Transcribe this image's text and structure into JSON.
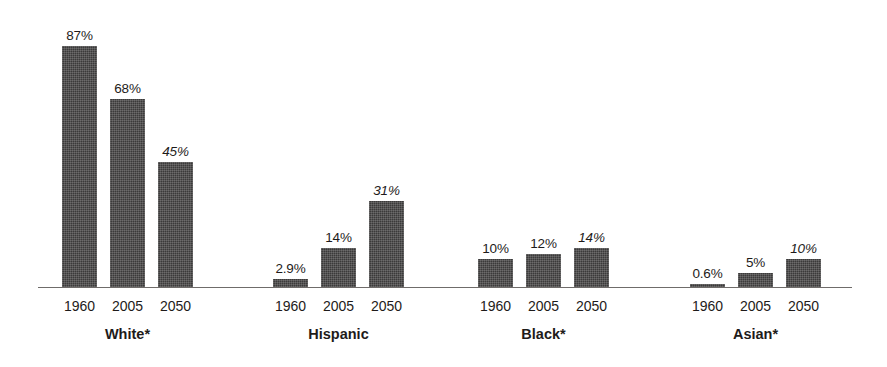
{
  "chart_data": {
    "type": "bar",
    "title": "",
    "subtitle": "",
    "xlabel": "",
    "ylabel": "",
    "ylim": [
      0,
      87
    ],
    "grid": false,
    "legend": "none",
    "axis": {
      "baseline_visible": true,
      "y_axis_visible": false
    },
    "categories": [
      "White*",
      "Hispanic",
      "Black*",
      "Asian*"
    ],
    "x": [
      "1960",
      "2005",
      "2050"
    ],
    "series": [
      {
        "name": "1960",
        "values": [
          87,
          2.9,
          10,
          0.6
        ]
      },
      {
        "name": "2005",
        "values": [
          68,
          14,
          12,
          5
        ]
      },
      {
        "name": "2050",
        "values": [
          45,
          31,
          14,
          10
        ]
      }
    ],
    "groups": [
      {
        "label": "White*",
        "bars": [
          {
            "year": "1960",
            "value": 87,
            "value_label": "87%",
            "projected": false
          },
          {
            "year": "2005",
            "value": 68,
            "value_label": "68%",
            "projected": false
          },
          {
            "year": "2050",
            "value": 45,
            "value_label": "45%",
            "projected": true
          }
        ]
      },
      {
        "label": "Hispanic",
        "bars": [
          {
            "year": "1960",
            "value": 2.9,
            "value_label": "2.9%",
            "projected": false
          },
          {
            "year": "2005",
            "value": 14,
            "value_label": "14%",
            "projected": false
          },
          {
            "year": "2050",
            "value": 31,
            "value_label": "31%",
            "projected": true
          }
        ]
      },
      {
        "label": "Black*",
        "bars": [
          {
            "year": "1960",
            "value": 10,
            "value_label": "10%",
            "projected": false
          },
          {
            "year": "2005",
            "value": 12,
            "value_label": "12%",
            "projected": false
          },
          {
            "year": "2050",
            "value": 14,
            "value_label": "14%",
            "projected": true
          }
        ]
      },
      {
        "label": "Asian*",
        "bars": [
          {
            "year": "1960",
            "value": 0.6,
            "value_label": "0.6%",
            "projected": false
          },
          {
            "year": "2005",
            "value": 5,
            "value_label": "5%",
            "projected": false
          },
          {
            "year": "2050",
            "value": 10,
            "value_label": "10%",
            "projected": true
          }
        ]
      }
    ],
    "colors": {
      "bar_fill": "#3b3a3a",
      "axis_line": "#6f6c6a",
      "text": "#1e1b1a",
      "background": "#ffffff"
    }
  },
  "layout": {
    "group_left_offsets": [
      62,
      273,
      478,
      690
    ],
    "baseline_y": 287,
    "bar_width": 35,
    "bar_gap": 13,
    "px_per_unit": 2.77,
    "axis_left": 38,
    "axis_width": 814
  }
}
